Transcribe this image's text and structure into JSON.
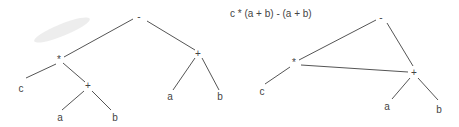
{
  "title": "c * (a + b) - (a + b)",
  "tree": {
    "nodes": [
      {
        "id": "t_minus",
        "label": "-",
        "x": 139,
        "y": 17
      },
      {
        "id": "t_mul",
        "label": "*",
        "x": 59,
        "y": 60
      },
      {
        "id": "t_c",
        "label": "c",
        "x": 21,
        "y": 89
      },
      {
        "id": "t_plus1",
        "label": "+",
        "x": 88,
        "y": 86
      },
      {
        "id": "t_a1",
        "label": "a",
        "x": 60,
        "y": 118
      },
      {
        "id": "t_b1",
        "label": "b",
        "x": 115,
        "y": 118
      },
      {
        "id": "t_plus2",
        "label": "+",
        "x": 198,
        "y": 54
      },
      {
        "id": "t_a2",
        "label": "a",
        "x": 170,
        "y": 97
      },
      {
        "id": "t_b2",
        "label": "b",
        "x": 220,
        "y": 97
      }
    ]
  },
  "dag": {
    "nodes": [
      {
        "id": "d_minus",
        "label": "-",
        "x": 381,
        "y": 18
      },
      {
        "id": "d_mul",
        "label": "*",
        "x": 294,
        "y": 63
      },
      {
        "id": "d_c",
        "label": "c",
        "x": 262,
        "y": 92
      },
      {
        "id": "d_plus",
        "label": "+",
        "x": 414,
        "y": 73
      },
      {
        "id": "d_a",
        "label": "a",
        "x": 387,
        "y": 107
      },
      {
        "id": "d_b",
        "label": "b",
        "x": 439,
        "y": 110
      }
    ]
  }
}
